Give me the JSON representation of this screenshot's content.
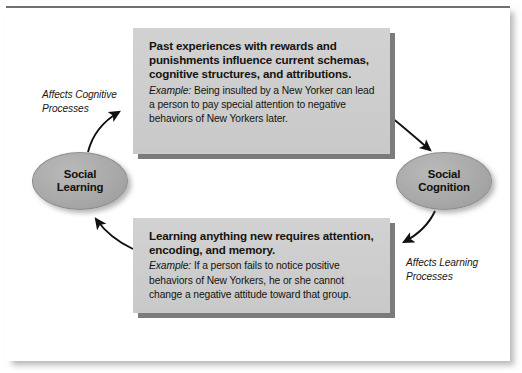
{
  "diagram": {
    "title_visible": false,
    "frame": {
      "border_color": "#6e7174",
      "background": "#ffffff"
    },
    "nodes": [
      {
        "id": "social-learning",
        "label": "Social\nLearning",
        "fill": "#a9a9a9",
        "position": "left"
      },
      {
        "id": "social-cognition",
        "label": "Social\nCognition",
        "fill": "#a9a9a9",
        "position": "right"
      }
    ],
    "boxes": [
      {
        "id": "box-top",
        "heading": "Past experiences with rewards and punishments influence current schemas, cognitive structures, and attributions.",
        "example_label": "Example:",
        "example_text": "Being insulted by a New Yorker can lead a person to pay special attention to negative behaviors of New Yorkers later.",
        "fill": "#cfcfcf",
        "shadow": "#7b7b7b"
      },
      {
        "id": "box-bottom",
        "heading": "Learning anything new requires attention, encoding, and memory.",
        "example_label": "Example:",
        "example_text": "If a person fails to notice positive behaviors of New Yorkers,  he or she cannot change a negative attitude toward that group.",
        "fill": "#cfcfcf",
        "shadow": "#7b7b7b"
      }
    ],
    "annotations": [
      {
        "id": "affects-cognitive-processes",
        "text": "Affects Cognitive\nProcesses",
        "position": "upper-left"
      },
      {
        "id": "affects-learning-processes",
        "text": "Affects Learning\nProcesses",
        "position": "lower-right"
      }
    ],
    "arrows": [
      {
        "id": "arrow-learning-to-top-box",
        "from": "social-learning",
        "to": "box-top",
        "direction": "up-right",
        "color": "#111111"
      },
      {
        "id": "arrow-top-box-to-cognition",
        "from": "box-top",
        "to": "social-cognition",
        "direction": "down-right",
        "color": "#111111"
      },
      {
        "id": "arrow-cognition-to-bottom-box",
        "from": "social-cognition",
        "to": "box-bottom",
        "direction": "down-left",
        "color": "#111111"
      },
      {
        "id": "arrow-bottom-box-to-learning",
        "from": "box-bottom",
        "to": "social-learning",
        "direction": "up-left",
        "color": "#111111"
      }
    ]
  }
}
